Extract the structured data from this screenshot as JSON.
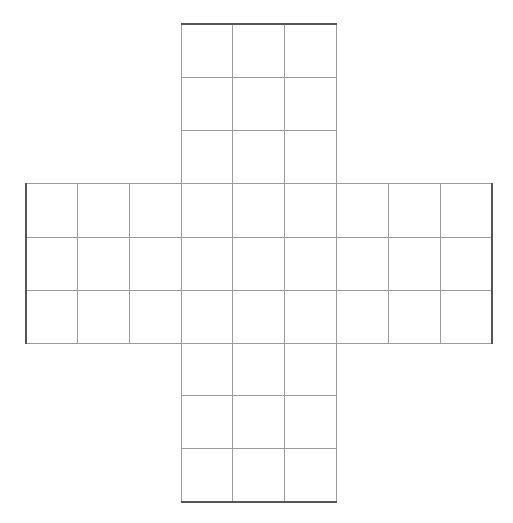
{
  "diagram": {
    "type": "cross-grid-net",
    "line_color": "#9a9a9a",
    "outline_color": "#555555",
    "cols_x": [
      25,
      77,
      129,
      181,
      232,
      284,
      336,
      388,
      440,
      492
    ],
    "rows_y": [
      23,
      77,
      130,
      183,
      237,
      290,
      343,
      395,
      448,
      502
    ],
    "blocks": [
      {
        "name": "top",
        "col_start": 3,
        "row_start": 0
      },
      {
        "name": "left",
        "col_start": 0,
        "row_start": 3
      },
      {
        "name": "center",
        "col_start": 3,
        "row_start": 3
      },
      {
        "name": "right",
        "col_start": 6,
        "row_start": 3
      },
      {
        "name": "bottom",
        "col_start": 3,
        "row_start": 6
      }
    ]
  }
}
